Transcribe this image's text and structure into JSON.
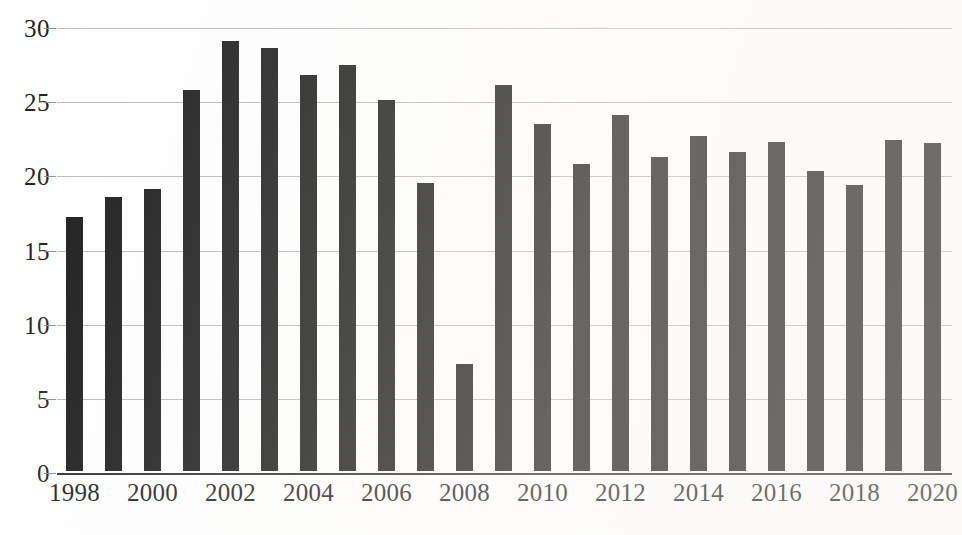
{
  "chart_data": {
    "type": "bar",
    "title": "",
    "subtitle": "",
    "xlabel": "",
    "ylabel": "",
    "categories": [
      "1998",
      "1999",
      "2000",
      "2001",
      "2002",
      "2003",
      "2004",
      "2005",
      "2006",
      "2007",
      "2008",
      "2009",
      "2010",
      "2011",
      "2012",
      "2013",
      "2014",
      "2015",
      "2016",
      "2017",
      "2018",
      "2019",
      "2020"
    ],
    "values": [
      17.1,
      18.5,
      19.0,
      25.7,
      29.0,
      28.5,
      26.7,
      27.4,
      25.0,
      19.4,
      7.2,
      26.0,
      23.4,
      20.7,
      24.0,
      21.2,
      22.6,
      21.5,
      22.2,
      20.2,
      19.3,
      22.3,
      22.1
    ],
    "ylim": [
      0,
      30
    ],
    "y_ticks": [
      0,
      5,
      10,
      15,
      20,
      25,
      30
    ],
    "y_tick_labels": [
      "0",
      "5",
      "10",
      "15",
      "20",
      "25",
      "30"
    ],
    "x_tick_labels": [
      "1998",
      "2000",
      "2002",
      "2004",
      "2006",
      "2008",
      "2010",
      "2012",
      "2014",
      "2016",
      "2018",
      "2020"
    ],
    "x_tick_categories": [
      "1998",
      "2000",
      "2002",
      "2004",
      "2006",
      "2008",
      "2010",
      "2012",
      "2014",
      "2016",
      "2018",
      "2020"
    ],
    "grid": true,
    "grid_axis": "y",
    "legend": false,
    "legend_position": "none",
    "series": [
      {
        "name": "",
        "color": "#171717",
        "values": [
          17.1,
          18.5,
          19.0,
          25.7,
          29.0,
          28.5,
          26.7,
          27.4,
          25.0,
          19.4,
          7.2,
          26.0,
          23.4,
          20.7,
          24.0,
          21.2,
          22.6,
          21.5,
          22.2,
          20.2,
          19.3,
          22.3,
          22.1
        ]
      }
    ],
    "annotations": []
  },
  "style": {
    "bar_color": "#171717",
    "grid_color": "#b9b9b9",
    "axis_color": "#2a2a2a",
    "text_color": "#1b1b1b",
    "background": "#fefefe"
  }
}
